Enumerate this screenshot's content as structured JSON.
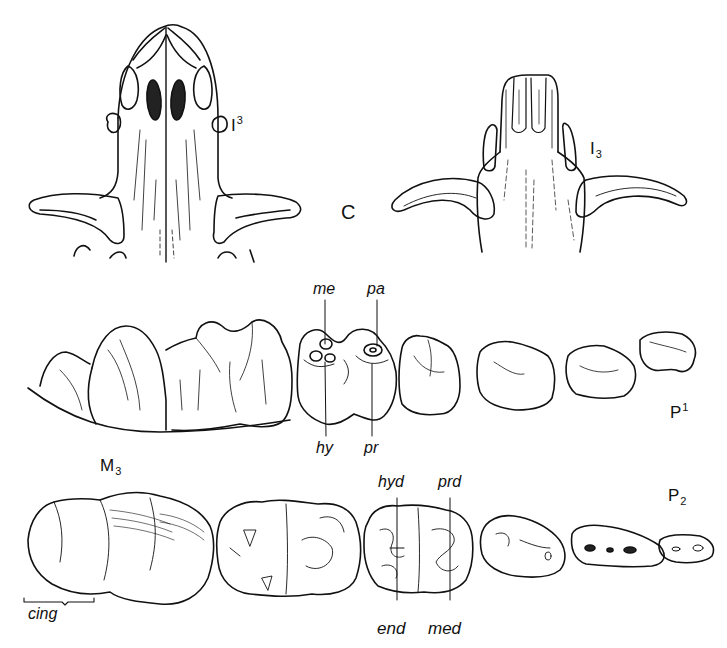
{
  "figure": {
    "panels": [
      {
        "id": "upper-incisors-canines",
        "label": "C",
        "tooth_label": {
          "base": "I",
          "sup": "3"
        }
      },
      {
        "id": "lower-incisors-canines",
        "tooth_label": {
          "base": "I",
          "sub": "3"
        }
      },
      {
        "id": "upper-cheek-teeth",
        "end_label": {
          "base": "P",
          "sup": "1"
        },
        "cusp_labels": [
          "me",
          "pa",
          "hy",
          "pr"
        ]
      },
      {
        "id": "lower-cheek-teeth",
        "start_label": {
          "base": "M",
          "sub": "3"
        },
        "end_label": {
          "base": "P",
          "sub": "2"
        },
        "cusp_labels": [
          "hyd",
          "prd",
          "end",
          "med"
        ],
        "bracket_label": "cing"
      }
    ]
  },
  "labels": {
    "upper_I3": {
      "base": "I",
      "mark": "3"
    },
    "lower_I3": {
      "base": "I",
      "mark": "3"
    },
    "C": "C",
    "me": "me",
    "pa": "pa",
    "hy": "hy",
    "pr": "pr",
    "P1": {
      "base": "P",
      "mark": "1"
    },
    "M3": {
      "base": "M",
      "mark": "3"
    },
    "hyd": "hyd",
    "prd": "prd",
    "P2": {
      "base": "P",
      "mark": "2"
    },
    "cing": "cing",
    "end": "end",
    "med": "med"
  },
  "colors": {
    "ink": "#111111",
    "background": "#ffffff",
    "shade": "#333333"
  }
}
